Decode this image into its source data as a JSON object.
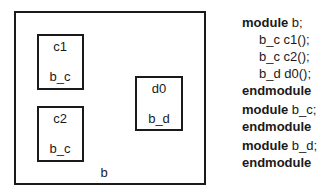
{
  "diagram": {
    "outer_module": {
      "label": "b"
    },
    "instances": [
      {
        "instance": "c1",
        "type": "b_c"
      },
      {
        "instance": "c2",
        "type": "b_c"
      },
      {
        "instance": "d0",
        "type": "b_d"
      }
    ]
  },
  "code": {
    "kw_module": "module",
    "kw_endmodule": "endmodule",
    "m1_name": " b;",
    "m1_lines": [
      "b_c c1();",
      "b_c c2();",
      "b_d d0();"
    ],
    "m2_name": " b_c;",
    "m3_name": " b_d;"
  }
}
